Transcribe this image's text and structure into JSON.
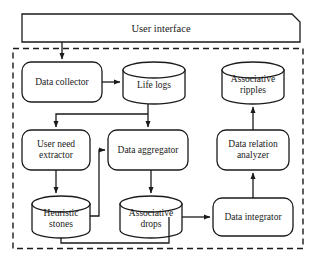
{
  "diagram": {
    "system_boundary": {
      "name": "system-boundary",
      "style": "dashed"
    },
    "colors": {
      "stroke": "#1a1a1a",
      "fill": "#ffffff",
      "text": "#1a1a1a",
      "boundary": "#1a1a1a"
    },
    "nodes": [
      {
        "id": "user-interface",
        "label": "User interface",
        "shape": "clipped-rect",
        "x": 22,
        "y": 14,
        "w": 278,
        "h": 28
      },
      {
        "id": "data-collector",
        "label": "Data collector",
        "shape": "rounded-rect",
        "x": 22,
        "y": 62,
        "w": 80,
        "h": 40
      },
      {
        "id": "life-logs",
        "label": "Life logs",
        "shape": "cylinder",
        "x": 123,
        "y": 62,
        "w": 62,
        "h": 42
      },
      {
        "id": "associative-ripples",
        "label": "Associative\nripples",
        "shape": "cylinder",
        "x": 222,
        "y": 62,
        "w": 62,
        "h": 42
      },
      {
        "id": "user-need-extractor",
        "label": "User need\nextractor",
        "shape": "rounded-rect",
        "x": 22,
        "y": 130,
        "w": 68,
        "h": 40
      },
      {
        "id": "data-aggregator",
        "label": "Data aggregator",
        "shape": "rounded-rect",
        "x": 108,
        "y": 130,
        "w": 80,
        "h": 40
      },
      {
        "id": "data-relation-analyzer",
        "label": "Data relation\nanalyzer",
        "shape": "rounded-rect",
        "x": 217,
        "y": 130,
        "w": 72,
        "h": 40
      },
      {
        "id": "heuristic-stones",
        "label": "Heuristic\nstones",
        "shape": "cylinder",
        "x": 32,
        "y": 196,
        "w": 58,
        "h": 42
      },
      {
        "id": "associative-drops",
        "label": "Associative\ndrops",
        "shape": "cylinder",
        "x": 120,
        "y": 196,
        "w": 62,
        "h": 42
      },
      {
        "id": "data-integrator",
        "label": "Data integrator",
        "shape": "rounded-rect",
        "x": 213,
        "y": 198,
        "w": 80,
        "h": 38
      }
    ],
    "edges": [
      {
        "id": "ui-to-data-collector",
        "from": "user-interface",
        "to": "data-collector",
        "arrow": true
      },
      {
        "id": "data-collector-to-life-logs",
        "from": "data-collector",
        "to": "life-logs",
        "arrow": true
      },
      {
        "id": "life-logs-to-data-aggregator",
        "from": "life-logs",
        "to": "data-aggregator",
        "arrow": true
      },
      {
        "id": "life-logs-to-user-need-extractor",
        "from": "life-logs",
        "to": "user-need-extractor",
        "arrow": true
      },
      {
        "id": "user-need-extractor-to-heuristic-stones",
        "from": "user-need-extractor",
        "to": "heuristic-stones",
        "arrow": true
      },
      {
        "id": "heuristic-stones-to-data-aggregator",
        "from": "heuristic-stones",
        "to": "data-aggregator",
        "arrow": true
      },
      {
        "id": "data-aggregator-to-associative-drops",
        "from": "data-aggregator",
        "to": "associative-drops",
        "arrow": true
      },
      {
        "id": "associative-drops-to-data-integrator",
        "from": "associative-drops",
        "to": "data-integrator",
        "arrow": true
      },
      {
        "id": "heuristic-stones-to-data-integrator",
        "from": "heuristic-stones",
        "to": "data-integrator",
        "arrow": true
      },
      {
        "id": "data-integrator-to-data-relation-analyzer",
        "from": "data-integrator",
        "to": "data-relation-analyzer",
        "arrow": true
      },
      {
        "id": "data-relation-analyzer-to-associative-ripples",
        "from": "data-relation-analyzer",
        "to": "associative-ripples",
        "arrow": true
      }
    ]
  }
}
